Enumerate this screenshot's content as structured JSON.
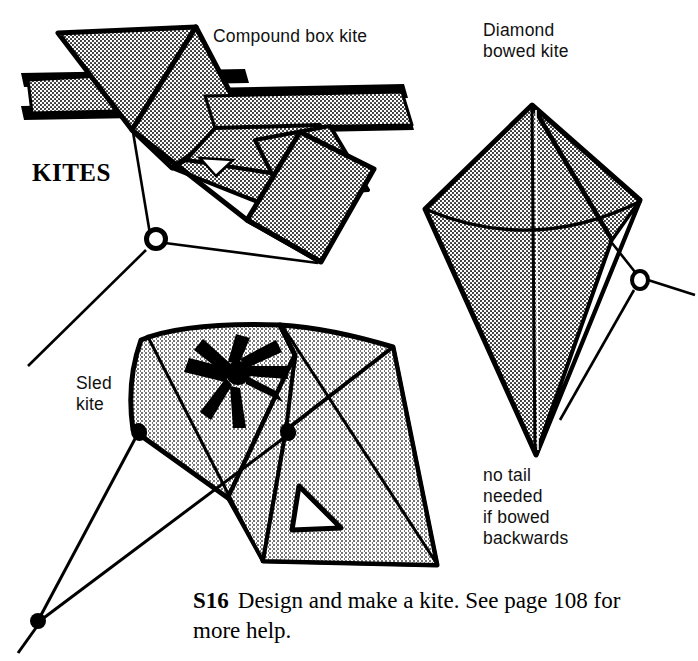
{
  "page": {
    "title": "KITES",
    "background_color": "#ffffff",
    "ink_color": "#000000",
    "fill_color": "#d8d8d8"
  },
  "labels": {
    "compound_box_kite": "Compound box kite",
    "diamond_bowed_kite": "Diamond\nbowed kite",
    "sled_kite": "Sled\nkite",
    "no_tail_note": "no tail\nneeded\nif bowed\nbackwards"
  },
  "caption": {
    "tag": "S16",
    "text": "Design and make a kite. See page 108 for more help."
  },
  "figures": [
    {
      "name": "compound-box-kite",
      "label": "Compound box kite",
      "parts": [
        "box cells",
        "cross spars",
        "bridle lines",
        "bridle ring"
      ]
    },
    {
      "name": "diamond-bowed-kite",
      "label": "Diamond bowed kite",
      "parts": [
        "sail",
        "spine",
        "bowed cross spar",
        "bridle lines",
        "bridle ring"
      ],
      "note": "no tail needed if bowed backwards"
    },
    {
      "name": "sled-kite",
      "label": "Sled kite",
      "parts": [
        "sail",
        "spars",
        "asterisk motif",
        "triangle cutout",
        "bridle lines",
        "bridle knot"
      ]
    }
  ]
}
